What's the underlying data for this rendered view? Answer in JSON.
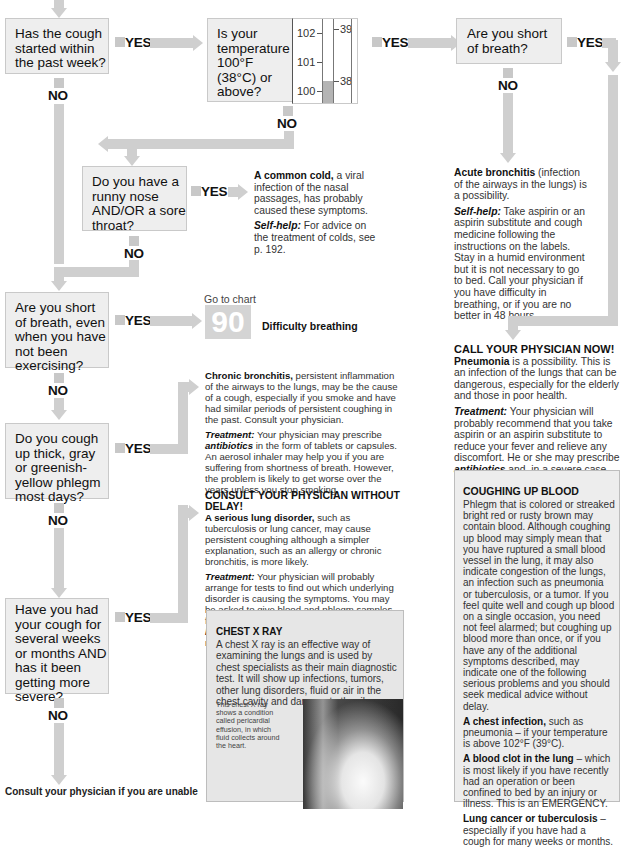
{
  "header_fragment": "Cough — see also p. 1",
  "questions": {
    "q1": "Has the cough started within the past week?",
    "q2": "Is your temperature 100°F (38°C) or above?",
    "q3": "Are you short of breath?",
    "q4": "Do you have a runny nose AND/OR a sore throat?",
    "q5": "Are you short of breath, even when you have not been exercising?",
    "q6": "Do you cough up thick, gray or greenish-yellow phlegm most days?",
    "q7": "Have you had your cough for several weeks or months AND has it been getting more severe?"
  },
  "labels": {
    "yes": "YES",
    "no": "NO"
  },
  "thermometer": {
    "fahrenheit": [
      "102",
      "101",
      "100"
    ],
    "celsius": [
      "39",
      "38"
    ]
  },
  "common_cold": {
    "title": "A common cold,",
    "body": " a viral infection of the nasal passages, has probably caused these symptoms.",
    "selfhelp_label": "Self-help:",
    "selfhelp": " For advice on the treatment of colds, see p. 192."
  },
  "acute_bronchitis": {
    "title": "Acute bronchitis",
    "body": " (infection of the airways in the lungs) is a possibility.",
    "selfhelp_label": "Self-help:",
    "selfhelp": " Take aspirin or an aspirin substitute and cough medicine following the instructions on the labels. Stay in a humid environment but it is not necessary to go to bed. Call your physician if you have difficulty in breathing, or if you are no better in 48 hours."
  },
  "goto_chart": {
    "prefix": "Go to chart",
    "number": "90",
    "title": "Difficulty breathing"
  },
  "pneumonia": {
    "heading": "CALL YOUR PHYSICIAN NOW!",
    "title": "Pneumonia",
    "body": " is a possibility. This is an infection of the lungs that can be dangerous, especially for the elderly and those in poor health.",
    "treatment_label": "Treatment:",
    "treatment": " Your physician will probably recommend that you take aspirin or an aspirin substitute to reduce your fever and relieve any discomfort. He or she may prescribe ",
    "treatment_em": "antibiotics",
    "treatment_end": " and, in a severe case, may advise admission to a hospital."
  },
  "chronic_bronchitis": {
    "title": "Chronic bronchitis,",
    "body": " persistent inflammation of the airways to the lungs, may be the cause of a cough, especially if you smoke and have had similar periods of persistent coughing in the past. Consult your physician.",
    "treatment_label": "Treatment:",
    "treatment": " Your physician may prescribe ",
    "treatment_em": "antibiotics",
    "treatment_end": " in the form of tablets or capsules. An aerosol inhaler may help you if you are suffering from shortness of breath. However, the problem is likely to get worse over the years unless you stop smoking."
  },
  "lung_disorder": {
    "heading": "CONSULT YOUR PHYSICIAN WITHOUT DELAY!",
    "title": "A serious lung disorder,",
    "body": " such as tuberculosis or lung cancer, may cause persistent coughing although a simpler explanation, such as an allergy or chronic bronchitis, is more likely.",
    "treatment_label": "Treatment:",
    "treatment": " Your physician will probably arrange for tests to find out which underlying disorder is causing the symptoms. You may be asked to give blood and phlegm samples for analysis. A ",
    "em1": "chest X ray",
    "mid": " (below) and ",
    "em2": "bronchoscopy",
    "end": " (opposite) may also be necessary."
  },
  "chest_xray": {
    "heading": "CHEST X RAY",
    "body": "A chest X ray is an effective way of examining the lungs and is used by chest specialists as their main diagnostic test. It will show up infections, tumors, other lung disorders, fluid or air in the chest cavity and damage to the rib cage.",
    "caption": "This chest X ray shows a condition called pericardial effusion, in which fluid collects around the heart."
  },
  "coughing_blood": {
    "heading": "COUGHING UP BLOOD",
    "body": "Phlegm that is colored or streaked bright red or rusty brown may contain blood. Although coughing up blood may simply mean that you have ruptured a small blood vessel in the lung, it may also indicate congestion of the lungs, an infection such as pneumonia or tuberculosis, or a tumor. If you feel quite well and cough up blood on a single occasion, you need not feel alarmed; but coughing up blood more than once, or if you have any of the additional symptoms described, may indicate one of the following serious problems and you should seek medical advice without delay.",
    "items": [
      {
        "title": "A chest infection,",
        "text": " such as pneumonia – if your temperature is above 102°F (39°C)."
      },
      {
        "title": "A blood clot in the lung",
        "text": " – which is most likely if you have recently had an operation or been confined to bed by an injury or illness. This is an EMERGENCY."
      },
      {
        "title": "Lung cancer or tuberculosis",
        "text": " – especially if you have had a cough for many weeks or months."
      }
    ]
  },
  "footer_fragment": "Consult your physician if you are unable"
}
